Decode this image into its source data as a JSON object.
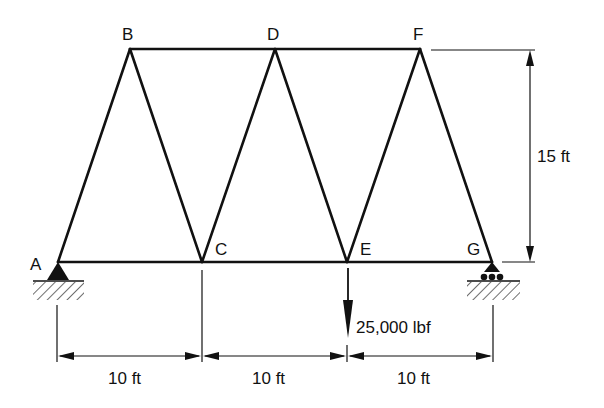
{
  "diagram": {
    "type": "truss",
    "joints": [
      {
        "id": "A",
        "label": "A"
      },
      {
        "id": "B",
        "label": "B"
      },
      {
        "id": "C",
        "label": "C"
      },
      {
        "id": "D",
        "label": "D"
      },
      {
        "id": "E",
        "label": "E"
      },
      {
        "id": "F",
        "label": "F"
      },
      {
        "id": "G",
        "label": "G"
      }
    ],
    "members": [
      "AB",
      "BC",
      "CD",
      "DE",
      "EF",
      "FG",
      "AC",
      "CE",
      "EG",
      "BD",
      "DF"
    ],
    "supports": {
      "A": "pin-support",
      "G": "roller-support"
    },
    "load": {
      "joint": "E",
      "label": "25,000 lbf",
      "direction": "down"
    },
    "dimensions": {
      "height_label": "15 ft",
      "spans": [
        "10 ft",
        "10 ft",
        "10 ft"
      ]
    }
  }
}
